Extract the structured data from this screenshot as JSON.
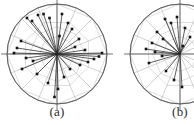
{
  "figure": {
    "type": "correlation-circle-biplot-pair",
    "background": "#ffffff",
    "panels": [
      {
        "id": "a",
        "caption": "(a)",
        "center_x": 60,
        "center_y": 54,
        "radius": 50,
        "clip_right": false
      },
      {
        "id": "b",
        "caption": "(b)",
        "center_x": 60,
        "center_y": 54,
        "radius": 50,
        "clip_right": true
      }
    ]
  },
  "style": {
    "circle_stroke": "#555555",
    "axis_stroke": "#3a3a3a",
    "spoke_stroke": "#9a9a9a",
    "web_stroke": "#bdbdbd",
    "vector_stroke": "#2a2a2a",
    "marker_fill": "#141414",
    "tick_label_color": "#8a8a8a",
    "caption_color": "#2b2b2b"
  },
  "chart_data": {
    "type": "scatter",
    "title": "",
    "subtitle": "",
    "xlabel": "",
    "ylabel": "",
    "xlim": [
      -1,
      1
    ],
    "ylim": [
      -1,
      1
    ],
    "grid": true,
    "grid_kind": "polar-spider",
    "legend": false,
    "legend_position": "none",
    "annotations": [
      "(a)",
      "(b)"
    ],
    "radial_spokes": 16,
    "web_rings": [
      0.35,
      0.68,
      1.0
    ],
    "series": [
      {
        "name": "panel-a-vectors",
        "panel": "a",
        "marker": "square",
        "points": [
          {
            "x": -0.6,
            "y": 0.72,
            "label": ""
          },
          {
            "x": -0.5,
            "y": 0.66,
            "label": ""
          },
          {
            "x": -0.38,
            "y": 0.78,
            "label": ""
          },
          {
            "x": -0.27,
            "y": 0.8,
            "label": ""
          },
          {
            "x": -0.15,
            "y": 0.72,
            "label": ""
          },
          {
            "x": 0.1,
            "y": 0.8,
            "label": ""
          },
          {
            "x": 0.22,
            "y": 0.62,
            "label": ""
          },
          {
            "x": 0.3,
            "y": 0.5,
            "label": ""
          },
          {
            "x": 0.05,
            "y": 0.36,
            "label": ""
          },
          {
            "x": -0.72,
            "y": 0.26,
            "label": ""
          },
          {
            "x": -0.8,
            "y": 0.12,
            "label": ""
          },
          {
            "x": -0.86,
            "y": 0.02,
            "label": ""
          },
          {
            "x": -0.62,
            "y": -0.08,
            "label": ""
          },
          {
            "x": -0.48,
            "y": -0.14,
            "label": ""
          },
          {
            "x": -0.7,
            "y": -0.3,
            "label": ""
          },
          {
            "x": -0.4,
            "y": -0.4,
            "label": ""
          },
          {
            "x": -0.18,
            "y": -0.58,
            "label": ""
          },
          {
            "x": 0.02,
            "y": -0.7,
            "label": ""
          },
          {
            "x": 0.14,
            "y": -0.46,
            "label": ""
          },
          {
            "x": 0.26,
            "y": -0.3,
            "label": ""
          },
          {
            "x": 0.46,
            "y": -0.22,
            "label": ""
          },
          {
            "x": 0.62,
            "y": -0.16,
            "label": ""
          },
          {
            "x": 0.74,
            "y": -0.1,
            "label": ""
          },
          {
            "x": 0.84,
            "y": -0.05,
            "label": ""
          },
          {
            "x": 0.9,
            "y": 0.02,
            "label": ""
          },
          {
            "x": 0.56,
            "y": 0.08,
            "label": ""
          },
          {
            "x": 0.36,
            "y": 0.14,
            "label": ""
          },
          {
            "x": 0.44,
            "y": 0.3,
            "label": ""
          },
          {
            "x": -0.05,
            "y": -0.86,
            "label": ""
          }
        ]
      },
      {
        "name": "panel-b-vectors",
        "panel": "b",
        "marker": "square",
        "points": [
          {
            "x": -0.3,
            "y": 0.7,
            "label": ""
          },
          {
            "x": -0.18,
            "y": 0.62,
            "label": ""
          },
          {
            "x": -0.06,
            "y": 0.74,
            "label": ""
          },
          {
            "x": -0.46,
            "y": 0.44,
            "label": ""
          },
          {
            "x": -0.34,
            "y": 0.3,
            "label": ""
          },
          {
            "x": -0.56,
            "y": 0.22,
            "label": ""
          },
          {
            "x": -0.68,
            "y": 0.1,
            "label": ""
          },
          {
            "x": -0.5,
            "y": 0.04,
            "label": ""
          },
          {
            "x": -0.36,
            "y": -0.04,
            "label": ""
          },
          {
            "x": -0.62,
            "y": -0.18,
            "label": ""
          },
          {
            "x": -0.28,
            "y": -0.34,
            "label": ""
          },
          {
            "x": -0.12,
            "y": -0.52,
            "label": ""
          },
          {
            "x": 0.04,
            "y": -0.66,
            "label": ""
          },
          {
            "x": 0.1,
            "y": 0.52,
            "label": ""
          },
          {
            "x": 0.2,
            "y": 0.34,
            "label": ""
          },
          {
            "x": 0.06,
            "y": 0.16,
            "label": ""
          }
        ]
      }
    ],
    "tick_labels": {
      "panel_a": [
        "0.5",
        "1.0",
        "0.5",
        "1.0",
        "0.5",
        "1.0",
        "0.5",
        "1.0"
      ],
      "panel_b": [
        "0.5",
        "1.0",
        "0.5",
        "1.0",
        "0.5",
        "1.0"
      ]
    }
  }
}
